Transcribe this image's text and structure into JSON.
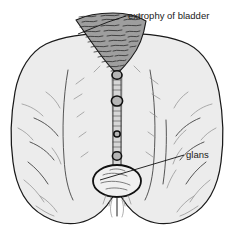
{
  "figure": {
    "view": "anterior view of male pelvis and upper thighs",
    "background_color": "#ffffff",
    "body_fill_color": "#ececec",
    "outline_color": "#1a1a1a",
    "bladder_fill_color": "#9e9e9e",
    "glans_fill_color": "#f0f0f0",
    "label_text_color": "#1a1a1a",
    "leader_line_color": "#111111"
  },
  "labels": [
    {
      "id": "bladder",
      "text": "extrophy of bladder",
      "text_x": 128,
      "text_y": 19,
      "anchor": "start",
      "leader_points": "126,16 108,22 78,34",
      "target_region": "exposed bladder plate"
    },
    {
      "id": "glans",
      "text": "glans",
      "text_x": 186,
      "text_y": 158,
      "anchor": "start",
      "leader_points": "184,155 100,180",
      "target_region": "glans penis"
    }
  ],
  "structures": [
    {
      "name": "exposed-bladder-plate",
      "description": "inverted triangular mucosal plate with dense squiggly hatching",
      "shading": "mid-gray"
    },
    {
      "name": "urethral-plate-strip",
      "description": "narrow vertical striped strip running down the midline",
      "shading": "light-gray"
    },
    {
      "name": "midline-nodules",
      "description": "four dark oval nodules spaced along the midline strip",
      "count": 4
    },
    {
      "name": "glans",
      "description": "pale oval at the lower end of the midline strip",
      "shading": "near-white"
    },
    {
      "name": "left-thigh",
      "description": "rounded thigh mass with curved contour creases"
    },
    {
      "name": "right-thigh",
      "description": "rounded thigh mass with curved contour creases"
    },
    {
      "name": "pelvic-torso",
      "description": "lower abdomen and hips forming the upper body silhouette"
    }
  ]
}
